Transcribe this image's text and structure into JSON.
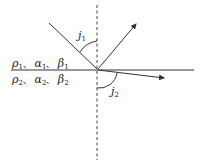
{
  "diagram": {
    "type": "ray reflection/refraction at interface",
    "medium_upper": {
      "rho": "ρ",
      "alpha": "α",
      "beta": "β",
      "index": "1",
      "sep": "、"
    },
    "medium_lower": {
      "rho": "ρ",
      "alpha": "α",
      "beta": "β",
      "index": "2",
      "sep": "、"
    },
    "angle_incident": {
      "symbol": "j",
      "index": "1"
    },
    "angle_refracted": {
      "symbol": "j",
      "index": "2"
    },
    "colors": {
      "line": "#333333",
      "dashed": "#444444",
      "background": "#ffffff"
    }
  }
}
